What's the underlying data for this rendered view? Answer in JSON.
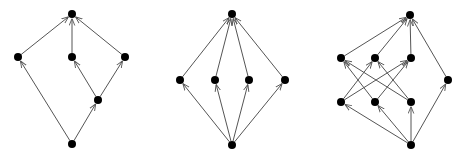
{
  "diagram": {
    "colors": {
      "edge": "#555555",
      "node": "#000000",
      "background": "#ffffff"
    },
    "node_radius": 4,
    "graphs": [
      {
        "name": "graph-1",
        "nodes": [
          {
            "id": "t",
            "x": 72,
            "y": 14
          },
          {
            "id": "a",
            "x": 18,
            "y": 57
          },
          {
            "id": "b",
            "x": 72,
            "y": 57
          },
          {
            "id": "c",
            "x": 125,
            "y": 57
          },
          {
            "id": "d",
            "x": 98,
            "y": 100
          },
          {
            "id": "s",
            "x": 72,
            "y": 144
          }
        ],
        "edges": [
          [
            "a",
            "t"
          ],
          [
            "b",
            "t"
          ],
          [
            "c",
            "t"
          ],
          [
            "s",
            "a"
          ],
          [
            "s",
            "d"
          ],
          [
            "d",
            "b"
          ],
          [
            "d",
            "c"
          ]
        ]
      },
      {
        "name": "graph-2",
        "nodes": [
          {
            "id": "t",
            "x": 232,
            "y": 14
          },
          {
            "id": "a",
            "x": 180,
            "y": 80
          },
          {
            "id": "b",
            "x": 215,
            "y": 80
          },
          {
            "id": "c",
            "x": 249,
            "y": 80
          },
          {
            "id": "d",
            "x": 285,
            "y": 80
          },
          {
            "id": "s",
            "x": 232,
            "y": 145
          }
        ],
        "edges": [
          [
            "a",
            "t"
          ],
          [
            "b",
            "t"
          ],
          [
            "c",
            "t"
          ],
          [
            "d",
            "t"
          ],
          [
            "s",
            "a"
          ],
          [
            "s",
            "b"
          ],
          [
            "s",
            "c"
          ],
          [
            "s",
            "d"
          ]
        ]
      },
      {
        "name": "graph-3",
        "nodes": [
          {
            "id": "t",
            "x": 410,
            "y": 15
          },
          {
            "id": "a",
            "x": 341,
            "y": 58
          },
          {
            "id": "b",
            "x": 375,
            "y": 58
          },
          {
            "id": "c",
            "x": 411,
            "y": 58
          },
          {
            "id": "d",
            "x": 341,
            "y": 102
          },
          {
            "id": "e",
            "x": 375,
            "y": 102
          },
          {
            "id": "f",
            "x": 411,
            "y": 102
          },
          {
            "id": "r",
            "x": 448,
            "y": 80
          },
          {
            "id": "s",
            "x": 411,
            "y": 145
          }
        ],
        "edges": [
          [
            "a",
            "t"
          ],
          [
            "b",
            "t"
          ],
          [
            "c",
            "t"
          ],
          [
            "r",
            "t"
          ],
          [
            "d",
            "b"
          ],
          [
            "d",
            "c"
          ],
          [
            "e",
            "a"
          ],
          [
            "e",
            "c"
          ],
          [
            "f",
            "a"
          ],
          [
            "f",
            "b"
          ],
          [
            "s",
            "d"
          ],
          [
            "s",
            "e"
          ],
          [
            "s",
            "f"
          ],
          [
            "s",
            "r"
          ]
        ]
      }
    ]
  }
}
